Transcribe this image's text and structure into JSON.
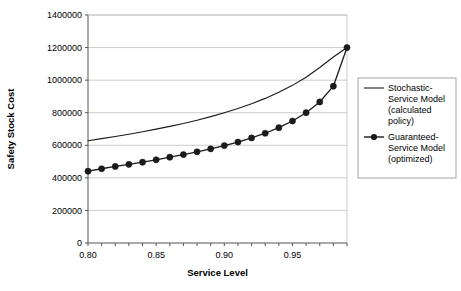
{
  "chart_data": {
    "type": "line",
    "title": "",
    "xlabel": "Service Level",
    "ylabel": "Safety Stock Cost",
    "xlim": [
      0.8,
      0.99
    ],
    "ylim": [
      0,
      1400000
    ],
    "grid": true,
    "legend_position": "right",
    "x_tick_labels": [
      "0.80",
      "0.85",
      "0.90",
      "0.95"
    ],
    "x_tick_values": [
      0.8,
      0.85,
      0.9,
      0.95
    ],
    "y_tick_labels": [
      "0",
      "200000",
      "400000",
      "600000",
      "800000",
      "1000000",
      "1200000",
      "1400000"
    ],
    "y_tick_values": [
      0,
      200000,
      400000,
      600000,
      800000,
      1000000,
      1200000,
      1400000
    ],
    "x": [
      0.8,
      0.81,
      0.82,
      0.83,
      0.84,
      0.85,
      0.86,
      0.87,
      0.88,
      0.89,
      0.9,
      0.91,
      0.92,
      0.93,
      0.94,
      0.95,
      0.96,
      0.97,
      0.98,
      0.99
    ],
    "series": [
      {
        "name": "Stochastic-Service Model (calculated policy)",
        "marker": "none",
        "color": "#1a1a1a",
        "values": [
          628000,
          641000,
          654000,
          668000,
          683000,
          699000,
          716000,
          734000,
          754000,
          776000,
          800000,
          826000,
          855000,
          888000,
          925000,
          968000,
          1018000,
          1078000,
          1142000,
          1200000
        ]
      },
      {
        "name": "Guaranteed-Service Model (optimized)",
        "marker": "filled-circle",
        "color": "#1a1a1a",
        "values": [
          441000,
          456000,
          470000,
          483000,
          496000,
          511000,
          527000,
          543000,
          560000,
          578000,
          598000,
          620000,
          645000,
          674000,
          708000,
          749000,
          800000,
          866000,
          963000,
          1200000
        ]
      }
    ]
  },
  "legend": {
    "entries": [
      {
        "label": "Stochastic-Service Model (calculated policy)",
        "marker": "line"
      },
      {
        "label": "Guaranteed-Service Model (optimized)",
        "marker": "line-with-dot"
      }
    ]
  }
}
